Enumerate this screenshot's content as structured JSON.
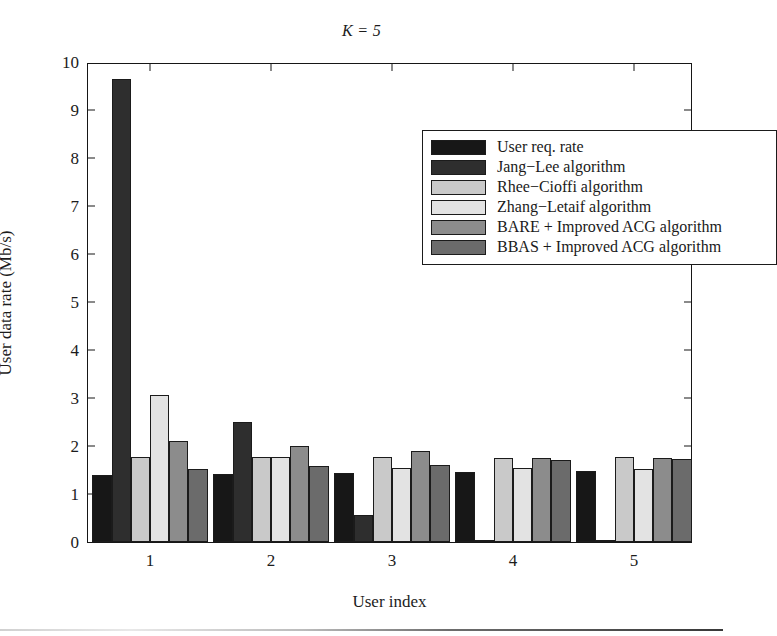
{
  "chart_data": {
    "type": "bar",
    "title": "K = 5",
    "xlabel": "User index",
    "ylabel": "User data rate (Mb/s)",
    "categories": [
      "1",
      "2",
      "3",
      "4",
      "5"
    ],
    "xtick_labels": [
      "1",
      "2",
      "3",
      "4",
      "5"
    ],
    "ytick_labels": [
      "0",
      "1",
      "2",
      "3",
      "4",
      "5",
      "6",
      "7",
      "8",
      "9",
      "10"
    ],
    "ylim": [
      0,
      10
    ],
    "xlim_note": "categorical, 5 user indices",
    "grid": false,
    "legend_position": "upper right inside axes",
    "series": [
      {
        "name": "User req. rate",
        "color": "#171717",
        "values": [
          1.4,
          1.42,
          1.43,
          1.45,
          1.47
        ]
      },
      {
        "name": "Jang−Lee algorithm",
        "color": "#2e2e2e",
        "values": [
          9.65,
          2.5,
          0.57,
          0.03,
          0.02
        ]
      },
      {
        "name": "Rhee−Cioffi algorithm",
        "color": "#c9c9c9",
        "values": [
          1.78,
          1.77,
          1.78,
          1.76,
          1.77
        ]
      },
      {
        "name": "Zhang−Letaif algorithm",
        "color": "#e3e3e3",
        "values": [
          3.07,
          1.77,
          1.55,
          1.55,
          1.52
        ]
      },
      {
        "name": "BARE + Improved ACG algorithm",
        "color": "#8c8c8c",
        "values": [
          2.1,
          2.0,
          1.9,
          1.74,
          1.76
        ]
      },
      {
        "name": "BBAS + Improved ACG algorithm",
        "color": "#6b6b6b",
        "values": [
          1.53,
          1.58,
          1.6,
          1.7,
          1.72
        ]
      }
    ]
  },
  "legend": {
    "items": [
      {
        "label": "User req. rate",
        "color": "#171717"
      },
      {
        "label": "Jang−Lee algorithm",
        "color": "#2e2e2e"
      },
      {
        "label": "Rhee−Cioffi algorithm",
        "color": "#c9c9c9"
      },
      {
        "label": "Zhang−Letaif algorithm",
        "color": "#e3e3e3"
      },
      {
        "label": "BARE + Improved ACG algorithm",
        "color": "#8c8c8c"
      },
      {
        "label": "BBAS + Improved ACG algorithm",
        "color": "#6b6b6b"
      }
    ]
  },
  "axes": {
    "title": "K = 5",
    "x_label": "User index",
    "y_label": "User data rate (Mb/s)"
  },
  "colors": {
    "axis": "#161616",
    "text": "#1c1c1c",
    "background": "#ffffff"
  }
}
